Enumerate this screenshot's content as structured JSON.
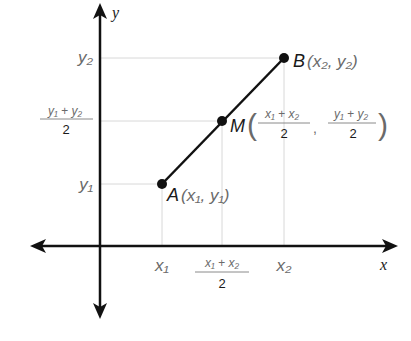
{
  "diagram": {
    "axes": {
      "x_label": "x",
      "y_label": "y"
    },
    "points": {
      "A": {
        "name": "A",
        "coords_text": "(x₁, y₁)",
        "x": "x₁",
        "y": "y₁"
      },
      "B": {
        "name": "B",
        "coords_text": "(x₂, y₂)",
        "x": "x₂",
        "y": "y₂"
      },
      "M": {
        "name": "M",
        "x_numerator": "x₁ + x₂",
        "y_numerator": "y₁ + y₂",
        "denominator": "2"
      }
    },
    "x_ticks": {
      "x1": "x₁",
      "mid_numerator": "x₁ + x₂",
      "mid_denominator": "2",
      "x2": "x₂"
    },
    "y_ticks": {
      "y2": "y₂",
      "mid_numerator": "y₁ + y₂",
      "mid_denominator": "2",
      "y1": "y₁"
    },
    "colors": {
      "axis": "#111111",
      "segment": "#111111",
      "gridline": "#d8d8d8",
      "label": "#6a6a6a"
    }
  }
}
